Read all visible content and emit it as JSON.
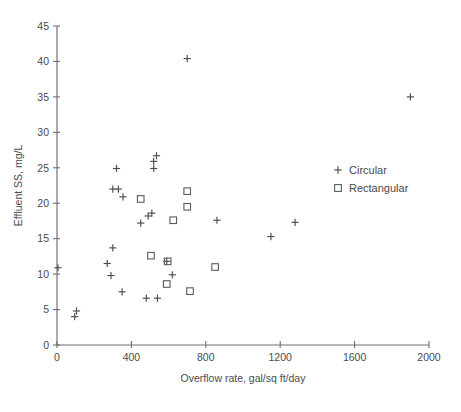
{
  "chart_data": {
    "type": "scatter",
    "title": "",
    "xlabel": "Overflow rate, gal/sq ft/day",
    "ylabel": "Effluent SS, mg/L",
    "xlim": [
      0,
      2000
    ],
    "ylim": [
      0,
      45
    ],
    "xticks": [
      0,
      400,
      800,
      1200,
      1600,
      2000
    ],
    "yticks": [
      0,
      5,
      10,
      15,
      20,
      25,
      30,
      35,
      40,
      45
    ],
    "xtick_labels": [
      "0",
      "400",
      "800",
      "1200",
      "1600",
      "2000"
    ],
    "ytick_labels": [
      "0",
      "5",
      "10",
      "15",
      "20",
      "25",
      "30",
      "35",
      "40",
      "45"
    ],
    "grid": false,
    "legend_position": "upper right",
    "series": [
      {
        "name": "Circular",
        "marker": "plus",
        "color": "#4b4b50",
        "points": [
          [
            5,
            10.9
          ],
          [
            105,
            4.8
          ],
          [
            95,
            4.0
          ],
          [
            270,
            11.5
          ],
          [
            300,
            13.7
          ],
          [
            290,
            9.8
          ],
          [
            300,
            22.0
          ],
          [
            330,
            22.0
          ],
          [
            320,
            24.9
          ],
          [
            355,
            20.9
          ],
          [
            350,
            7.5
          ],
          [
            450,
            17.2
          ],
          [
            490,
            18.2
          ],
          [
            510,
            18.6
          ],
          [
            520,
            25.9
          ],
          [
            535,
            26.7
          ],
          [
            520,
            24.9
          ],
          [
            480,
            6.6
          ],
          [
            540,
            6.6
          ],
          [
            590,
            11.8
          ],
          [
            620,
            9.9
          ],
          [
            700,
            40.4
          ],
          [
            860,
            17.6
          ],
          [
            1150,
            15.3
          ],
          [
            1280,
            17.3
          ],
          [
            1900,
            35.0
          ]
        ]
      },
      {
        "name": "Rectangular",
        "marker": "square",
        "color": "#5a5a60",
        "points": [
          [
            450,
            20.6
          ],
          [
            505,
            12.6
          ],
          [
            595,
            11.8
          ],
          [
            590,
            8.6
          ],
          [
            625,
            17.6
          ],
          [
            700,
            21.7
          ],
          [
            700,
            19.5
          ],
          [
            715,
            7.6
          ],
          [
            850,
            11.0
          ]
        ]
      }
    ]
  },
  "legend": {
    "items": [
      {
        "label": "Circular",
        "marker": "plus"
      },
      {
        "label": "Rectangular",
        "marker": "square"
      }
    ]
  },
  "axes": {
    "x_title": "Overflow rate, gal/sq ft/day",
    "y_title": "Effluent SS, mg/L"
  }
}
